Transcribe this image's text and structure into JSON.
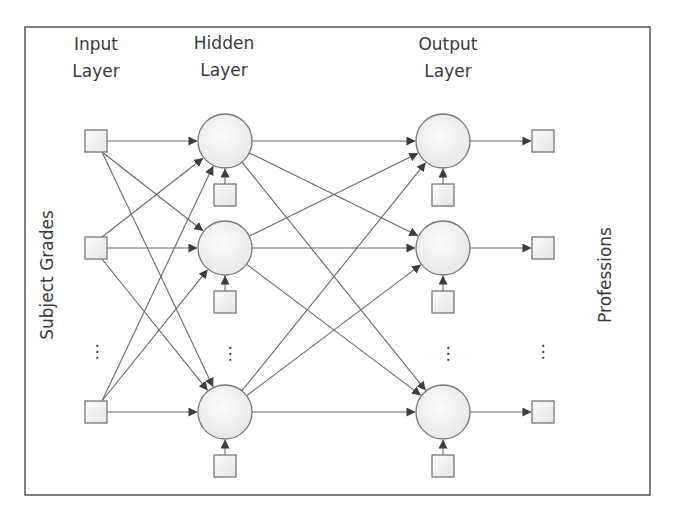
{
  "diagram": {
    "layers": [
      {
        "id": "input",
        "label_line1": "Input",
        "label_line2": "Layer",
        "node_shape": "square",
        "nodes": [
          "x1",
          "x2",
          "xn"
        ]
      },
      {
        "id": "hidden",
        "label_line1": "Hidden",
        "label_line2": "Layer",
        "node_shape": "circle",
        "nodes": [
          "h1",
          "h2",
          "hm"
        ],
        "bias": true
      },
      {
        "id": "output",
        "label_line1": "Output",
        "label_line2": "Layer",
        "node_shape": "circle",
        "nodes": [
          "o1",
          "o2",
          "ok"
        ],
        "bias": true
      },
      {
        "id": "result",
        "label_line1": "",
        "label_line2": "",
        "node_shape": "square",
        "nodes": [
          "y1",
          "y2",
          "yk"
        ]
      }
    ],
    "side_labels": {
      "left": "Subject Grades",
      "right": "Professions"
    },
    "ellipsis_glyph": "⋮",
    "connections": {
      "input_to_hidden": "fully-connected",
      "hidden_to_output": "fully-connected",
      "output_to_result": "one-to-one",
      "bias_to_node": "one-to-one"
    },
    "colors": {
      "stroke": "#6a6a6a",
      "node_fill_light": "#f7f7f7",
      "node_fill_dark": "#e4e4e4",
      "text": "#3a3a3a"
    }
  }
}
